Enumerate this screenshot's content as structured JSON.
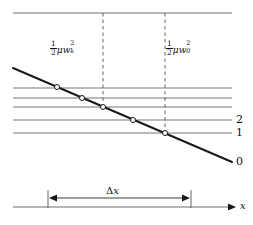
{
  "figure": {
    "type": "physics-diagram",
    "background": "#ffffff",
    "line_color": "#777777",
    "bold_line_color": "#1a1a1a",
    "dash_color": "#555555",
    "marker_fill": "#ffffff",
    "marker_stroke": "#1a1a1a"
  },
  "labels": {
    "left_energy": {
      "text": "1/2 μw_k^2",
      "fraction_numerator": "1",
      "fraction_denominator": "2",
      "greek_mu": "μ",
      "variable": "w",
      "subscript": "k",
      "superscript": "2",
      "x": 50,
      "y": 40
    },
    "right_energy": {
      "text": "1/2 μw_0^2",
      "fraction_numerator": "1",
      "fraction_denominator": "2",
      "greek_mu": "μ",
      "variable": "w",
      "subscript": "0",
      "superscript": "2",
      "x": 166,
      "y": 40
    },
    "delta_x": {
      "delta": "Δ",
      "variable": "x",
      "x": 106,
      "y": 186
    },
    "axis_x": {
      "text": "x",
      "x": 240,
      "y": 201
    },
    "levels": [
      {
        "text": "2",
        "x": 236,
        "y": 114
      },
      {
        "text": "1",
        "x": 236,
        "y": 127
      },
      {
        "text": "0",
        "x": 236,
        "y": 156
      }
    ]
  },
  "geometry": {
    "plot_left": 13,
    "plot_right": 232,
    "top_line_y": 13,
    "horizontal_levels_y": [
      88,
      98,
      107,
      120,
      133
    ],
    "vertical_dashed_x": [
      103,
      165
    ],
    "vertical_dashed_top": 13,
    "vertical_dashed_bottoms": [
      107,
      133
    ],
    "diagonal_start": {
      "x": 13,
      "y": 68
    },
    "diagonal_end": {
      "x": 232,
      "y": 162
    },
    "markers": [
      {
        "x": 57,
        "y": 87
      },
      {
        "x": 82,
        "y": 98
      },
      {
        "x": 103,
        "y": 107
      },
      {
        "x": 133,
        "y": 120
      },
      {
        "x": 165,
        "y": 133
      }
    ],
    "baseline_axis_y": 207,
    "baseline_axis_left": 13,
    "baseline_axis_right": 228,
    "dx_arrow_y": 198,
    "dx_left_x": 48,
    "dx_right_x": 191,
    "tick_top_y": 190,
    "tick_bottom_y": 208
  }
}
